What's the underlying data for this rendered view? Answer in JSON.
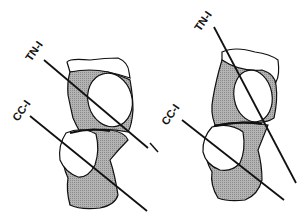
{
  "figure": {
    "panels": [
      {
        "id": "left",
        "labels": {
          "upper_line": "TN-I",
          "lower_line": "CC-I"
        }
      },
      {
        "id": "right",
        "labels": {
          "upper_line": "TN-I",
          "lower_line": "CC-I"
        }
      }
    ],
    "colors": {
      "ink": "#111111",
      "shade": "#a9a9a9",
      "background": "#ffffff"
    }
  }
}
